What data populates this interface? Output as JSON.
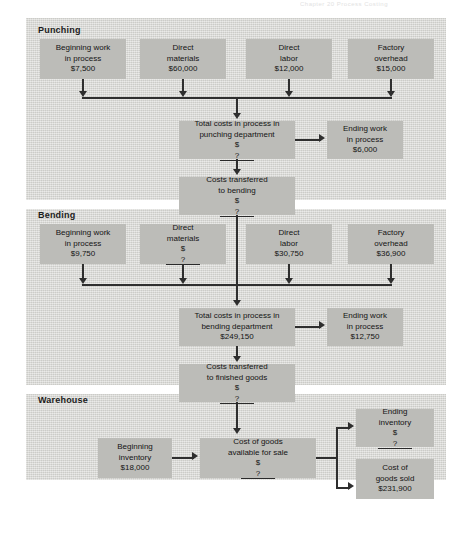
{
  "running_head": "Chapter 20   Process Costing",
  "exhibit": {
    "sections": [
      {
        "id": "punching",
        "label": "Punching"
      },
      {
        "id": "bending",
        "label": "Bending"
      },
      {
        "id": "warehouse",
        "label": "Warehouse"
      }
    ],
    "punching": {
      "inputs": [
        {
          "name": "beginning-wip",
          "line1": "Beginning work",
          "line2": "in process",
          "amount": "$7,500"
        },
        {
          "name": "direct-materials",
          "line1": "Direct",
          "line2": "materials",
          "amount": "$60,000"
        },
        {
          "name": "direct-labor",
          "line1": "Direct",
          "line2": "labor",
          "amount": "$12,000"
        },
        {
          "name": "factory-overhead",
          "line1": "Factory",
          "line2": "overhead",
          "amount": "$15,000"
        }
      ],
      "total_costs": {
        "line1": "Total costs in process in",
        "line2": "punching department",
        "currency": "$",
        "amount": "?"
      },
      "ending_wip": {
        "line1": "Ending work",
        "line2": "in process",
        "amount": "$6,000"
      },
      "transferred": {
        "line1": "Costs transferred",
        "line2": "to bending",
        "currency": "$",
        "amount": "?"
      }
    },
    "bending": {
      "inputs": [
        {
          "name": "beginning-wip",
          "line1": "Beginning work",
          "line2": "in process",
          "amount": "$9,750"
        },
        {
          "name": "direct-materials",
          "line1": "Direct",
          "line2": "materials",
          "currency": "$",
          "amount": "?"
        },
        {
          "name": "direct-labor",
          "line1": "Direct",
          "line2": "labor",
          "amount": "$30,750"
        },
        {
          "name": "factory-overhead",
          "line1": "Factory",
          "line2": "overhead",
          "amount": "$36,900"
        }
      ],
      "total_costs": {
        "line1": "Total costs in process in",
        "line2": "bending department",
        "amount": "$249,150"
      },
      "ending_wip": {
        "line1": "Ending work",
        "line2": "in process",
        "amount": "$12,750"
      },
      "transferred": {
        "line1": "Costs transferred",
        "line2": "to finished goods",
        "currency": "$",
        "amount": "?"
      }
    },
    "warehouse": {
      "beginning_inventory": {
        "line1": "Beginning",
        "line2": "inventory",
        "amount": "$18,000"
      },
      "goods_available": {
        "line1": "Cost of goods",
        "line2": "available for sale",
        "currency": "$",
        "amount": "?"
      },
      "ending_inventory": {
        "line1": "Ending",
        "line2": "inventory",
        "currency": "$",
        "amount": "?"
      },
      "cost_of_goods_sold": {
        "line1": "Cost of",
        "line2": "goods sold",
        "amount": "$231,900"
      }
    }
  },
  "colors": {
    "panel_bg": "#d9d9d5",
    "box_bg": "#bcbcb8",
    "line": "#2e2e2e",
    "text": "#141414",
    "page_bg": "#ffffff"
  }
}
